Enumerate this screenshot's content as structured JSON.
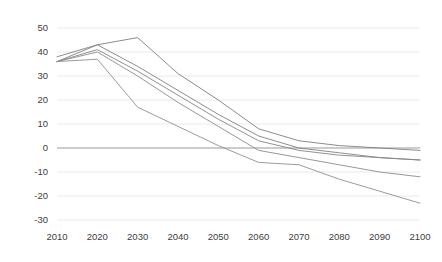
{
  "chart_data": {
    "type": "line",
    "title": "",
    "subtitle": "",
    "xlabel": "",
    "ylabel": "",
    "x": [
      2010,
      2020,
      2030,
      2040,
      2050,
      2060,
      2070,
      2080,
      2090,
      2100
    ],
    "xtick_labels": [
      "2010",
      "2020",
      "2030",
      "2040",
      "2050",
      "2060",
      "2070",
      "2080",
      "2090",
      "2100"
    ],
    "ytick_labels": [
      "50",
      "40",
      "30",
      "20",
      "10",
      "0",
      "-10",
      "-20",
      "-30"
    ],
    "yticks": [
      50,
      40,
      30,
      20,
      10,
      0,
      -10,
      -20,
      -30
    ],
    "ylim": [
      -30,
      50
    ],
    "xlim": [
      2010,
      2100
    ],
    "grid": true,
    "grid_axis": "y",
    "legend": false,
    "zero_line": true,
    "series": [
      {
        "name": "series-1",
        "color": "#7f7f7f",
        "values": [
          38,
          43,
          46,
          31,
          20,
          8,
          3,
          1,
          0,
          -1
        ]
      },
      {
        "name": "series-2",
        "color": "#808080",
        "values": [
          36,
          43,
          34,
          24,
          14,
          5,
          0,
          -2,
          -4,
          -5
        ]
      },
      {
        "name": "series-3",
        "color": "#858585",
        "values": [
          36,
          41,
          32,
          22,
          12,
          3,
          -1,
          -3,
          -4,
          -5
        ]
      },
      {
        "name": "series-4",
        "color": "#8c8c8c",
        "values": [
          36,
          40,
          30,
          19,
          9,
          -1,
          -4,
          -7,
          -10,
          -12
        ]
      },
      {
        "name": "series-5",
        "color": "#909090",
        "values": [
          36,
          37,
          17,
          9,
          1,
          -6,
          -7,
          -13,
          -18,
          -23
        ]
      }
    ]
  },
  "axes": {
    "plot_left": 57,
    "plot_right": 420,
    "plot_top": 28,
    "plot_bottom": 220
  }
}
